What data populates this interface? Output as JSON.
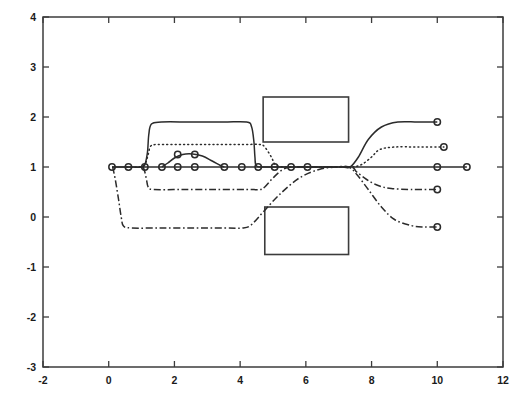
{
  "chart_data": {
    "type": "line",
    "title": "",
    "xlabel": "",
    "ylabel": "",
    "xlim": [
      -2,
      12
    ],
    "ylim": [
      -3,
      4
    ],
    "grid": false,
    "legend": "none",
    "xticks": [
      -2,
      0,
      2,
      4,
      6,
      8,
      10,
      12
    ],
    "xtick_labels": [
      "-2",
      "0",
      "2",
      "4",
      "6",
      "8",
      "10",
      "12"
    ],
    "yticks": [
      -3,
      -2,
      -1,
      0,
      1,
      2,
      3,
      4
    ],
    "ytick_labels": [
      "-3",
      "-2",
      "-1",
      "0",
      "1",
      "2",
      "3",
      "4"
    ],
    "annotations": [
      {
        "name": "upper-obstacle",
        "type": "rectangle",
        "x0": 4.7,
        "y0": 1.5,
        "x1": 7.3,
        "y1": 2.4
      },
      {
        "name": "lower-obstacle",
        "type": "rectangle",
        "x0": 4.75,
        "y0": -0.75,
        "x1": 7.3,
        "y1": 0.2
      }
    ],
    "series": [
      {
        "name": "agent-1-solid-upper",
        "style": "solid",
        "points": [
          [
            0.1,
            1.0
          ],
          [
            0.6,
            1.0
          ],
          [
            1.0,
            1.0
          ],
          [
            1.1,
            1.05
          ],
          [
            1.18,
            1.3
          ],
          [
            1.22,
            1.65
          ],
          [
            1.3,
            1.86
          ],
          [
            1.6,
            1.9
          ],
          [
            2.5,
            1.9
          ],
          [
            3.5,
            1.9
          ],
          [
            4.2,
            1.9
          ],
          [
            4.35,
            1.8
          ],
          [
            4.42,
            1.5
          ],
          [
            4.45,
            1.2
          ],
          [
            4.5,
            1.02
          ],
          [
            4.8,
            1.0
          ],
          [
            5.6,
            1.0
          ],
          [
            6.4,
            1.0
          ],
          [
            7.1,
            1.0
          ],
          [
            7.35,
            1.0
          ],
          [
            7.6,
            1.2
          ],
          [
            7.9,
            1.55
          ],
          [
            8.3,
            1.8
          ],
          [
            8.8,
            1.9
          ],
          [
            9.4,
            1.9
          ],
          [
            10.0,
            1.9
          ]
        ],
        "markers": [
          [
            10.0,
            1.9
          ]
        ]
      },
      {
        "name": "agent-2-dotted",
        "style": "dotted",
        "points": [
          [
            0.55,
            1.0
          ],
          [
            0.9,
            1.0
          ],
          [
            1.1,
            1.05
          ],
          [
            1.2,
            1.25
          ],
          [
            1.28,
            1.42
          ],
          [
            1.5,
            1.45
          ],
          [
            2.3,
            1.45
          ],
          [
            3.2,
            1.45
          ],
          [
            4.1,
            1.45
          ],
          [
            4.6,
            1.45
          ],
          [
            4.75,
            1.4
          ],
          [
            4.95,
            1.2
          ],
          [
            5.1,
            1.03
          ],
          [
            5.5,
            1.0
          ],
          [
            6.3,
            1.0
          ],
          [
            7.0,
            1.0
          ],
          [
            7.4,
            1.0
          ],
          [
            7.7,
            1.05
          ],
          [
            8.0,
            1.2
          ],
          [
            8.25,
            1.35
          ],
          [
            8.7,
            1.4
          ],
          [
            9.4,
            1.4
          ],
          [
            10.2,
            1.4
          ]
        ],
        "markers": [
          [
            10.2,
            1.4
          ]
        ]
      },
      {
        "name": "agent-3-solid-baseline",
        "style": "solid",
        "points": [
          [
            0.1,
            1.0
          ],
          [
            1.2,
            1.0
          ],
          [
            2.0,
            1.0
          ],
          [
            3.0,
            1.0
          ],
          [
            4.0,
            1.0
          ],
          [
            5.0,
            1.0
          ],
          [
            6.0,
            1.0
          ],
          [
            7.0,
            1.0
          ],
          [
            8.0,
            1.0
          ],
          [
            9.0,
            1.0
          ],
          [
            10.0,
            1.0
          ],
          [
            10.9,
            1.0
          ]
        ],
        "markers": [
          [
            0.1,
            1.0
          ],
          [
            0.6,
            1.0
          ],
          [
            1.1,
            1.0
          ],
          [
            1.62,
            1.0
          ],
          [
            2.1,
            1.0
          ],
          [
            2.62,
            1.0
          ],
          [
            3.52,
            1.0
          ],
          [
            4.05,
            1.0
          ],
          [
            4.55,
            1.0
          ],
          [
            5.05,
            1.0
          ],
          [
            5.55,
            1.0
          ],
          [
            6.05,
            1.0
          ],
          [
            10.0,
            1.0
          ],
          [
            10.9,
            1.0
          ]
        ]
      },
      {
        "name": "agent-4-solid-bump",
        "style": "solid",
        "points": [
          [
            1.62,
            1.0
          ],
          [
            1.8,
            1.08
          ],
          [
            2.0,
            1.18
          ],
          [
            2.25,
            1.25
          ],
          [
            2.55,
            1.26
          ],
          [
            2.85,
            1.22
          ],
          [
            3.15,
            1.12
          ],
          [
            3.4,
            1.03
          ],
          [
            3.52,
            1.0
          ]
        ],
        "markers": [
          [
            2.1,
            1.25
          ],
          [
            2.62,
            1.25
          ]
        ]
      },
      {
        "name": "agent-5-dashdot-mid",
        "style": "dashdot",
        "points": [
          [
            1.05,
            1.0
          ],
          [
            1.1,
            0.9
          ],
          [
            1.15,
            0.75
          ],
          [
            1.2,
            0.6
          ],
          [
            1.35,
            0.55
          ],
          [
            2.2,
            0.55
          ],
          [
            3.2,
            0.55
          ],
          [
            4.2,
            0.55
          ],
          [
            4.6,
            0.55
          ],
          [
            4.75,
            0.6
          ],
          [
            5.0,
            0.78
          ],
          [
            5.3,
            0.95
          ],
          [
            5.6,
            1.0
          ],
          [
            6.5,
            1.0
          ],
          [
            7.35,
            1.0
          ],
          [
            7.55,
            0.9
          ],
          [
            7.85,
            0.75
          ],
          [
            8.2,
            0.63
          ],
          [
            8.6,
            0.57
          ],
          [
            9.2,
            0.55
          ],
          [
            10.0,
            0.55
          ]
        ],
        "markers": [
          [
            10.0,
            0.55
          ]
        ]
      },
      {
        "name": "agent-6-dashdot-lower",
        "style": "dashdot",
        "points": [
          [
            0.12,
            1.0
          ],
          [
            0.2,
            0.75
          ],
          [
            0.3,
            0.35
          ],
          [
            0.38,
            0.0
          ],
          [
            0.45,
            -0.18
          ],
          [
            0.7,
            -0.22
          ],
          [
            1.6,
            -0.22
          ],
          [
            2.6,
            -0.22
          ],
          [
            3.5,
            -0.22
          ],
          [
            4.1,
            -0.22
          ],
          [
            4.35,
            -0.15
          ],
          [
            4.7,
            0.1
          ],
          [
            5.2,
            0.45
          ],
          [
            5.8,
            0.78
          ],
          [
            6.4,
            0.95
          ],
          [
            6.9,
            1.0
          ],
          [
            7.3,
            1.0
          ],
          [
            7.55,
            0.85
          ],
          [
            7.9,
            0.55
          ],
          [
            8.3,
            0.2
          ],
          [
            8.7,
            -0.05
          ],
          [
            9.2,
            -0.17
          ],
          [
            9.6,
            -0.2
          ],
          [
            10.0,
            -0.2
          ]
        ],
        "markers": [
          [
            10.0,
            -0.2
          ]
        ]
      }
    ],
    "marker_shape": "circle",
    "marker_size_px": 3.2
  }
}
